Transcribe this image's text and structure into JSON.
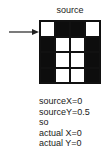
{
  "diagram": {
    "title": "source",
    "grid": {
      "rows": 4,
      "cols": 4,
      "cells": [
        [
          "white",
          "black",
          "black",
          "white"
        ],
        [
          "black",
          "white",
          "white",
          "black"
        ],
        [
          "black",
          "white",
          "white",
          "black"
        ],
        [
          "black",
          "white",
          "white",
          "black"
        ]
      ]
    },
    "arrow": {
      "icon": "arrow-right-icon",
      "points_to_row": 0
    },
    "lines": [
      "sourceX=0",
      "sourceY=0.5",
      "so",
      "actual X=0",
      "actual Y=0"
    ]
  }
}
